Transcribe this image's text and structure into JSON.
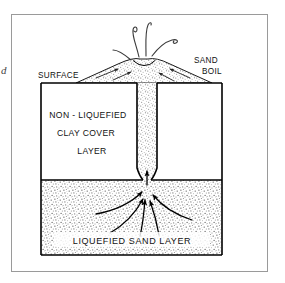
{
  "figure": {
    "edge_mark": "d",
    "labels": {
      "surface": "SURFACE",
      "sand": "SAND",
      "boil": "BOIL",
      "clay_line1": "NON - LIQUEFIED",
      "clay_line2": "CLAY   COVER",
      "clay_line3": "LAYER",
      "bottom_layer": "LIQUEFIED   SAND   LAYER"
    },
    "colors": {
      "frame": "#9a9a9a",
      "outline": "#000000",
      "sand_stipple": "#6f6f6f",
      "background": "#ffffff",
      "text": "#111111"
    },
    "regions": [
      {
        "name": "non-liquefied-clay-cover-layer",
        "fill": "white"
      },
      {
        "name": "liquefied-sand-layer",
        "fill": "stippled"
      },
      {
        "name": "sand-vent-channel",
        "fill": "stippled"
      },
      {
        "name": "sand-boil-mound",
        "fill": "stippled"
      }
    ]
  }
}
